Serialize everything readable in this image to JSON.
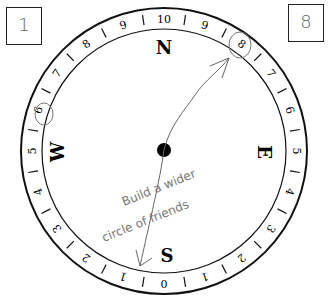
{
  "left_box": {
    "value": "1"
  },
  "right_box": {
    "value": "8"
  },
  "compass": {
    "center": [
      164,
      151
    ],
    "outer_radius": 143,
    "inner_radius": 122,
    "cardinals": {
      "north": "N",
      "east": "E",
      "south": "S",
      "west": "W"
    },
    "ring_numbers_right": [
      "10",
      "9",
      "8",
      "7",
      "6",
      "5",
      "4",
      "3",
      "2",
      "1",
      "0"
    ],
    "ring_numbers_left": [
      "0",
      "1",
      "2",
      "3",
      "4",
      "5",
      "6",
      "7",
      "8",
      "9",
      "10"
    ],
    "circled_left": "6",
    "circled_right": "8"
  },
  "annotation": {
    "line1": "Build a wider",
    "line2": "circle of friends"
  },
  "colors": {
    "ink": "#111111",
    "pencil": "#777777"
  }
}
